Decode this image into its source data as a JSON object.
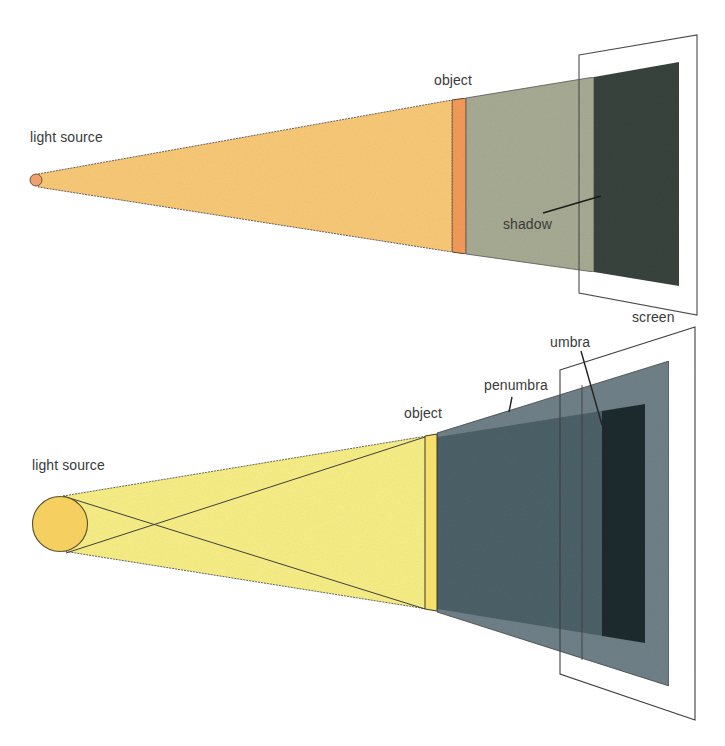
{
  "diagrams": [
    {
      "id": "point-source",
      "labels": {
        "light_source": "light source",
        "object": "object",
        "shadow": "shadow",
        "screen": "screen"
      },
      "colors": {
        "light_beam": "#f9c977",
        "light_source": "#f0a06a",
        "object": "#f29b5a",
        "shadow_penumbra_area": "#a7ab93",
        "shadow": "#3a4540",
        "outline": "#4a4a4a"
      }
    },
    {
      "id": "extended-source",
      "labels": {
        "light_source": "light source",
        "object": "object",
        "penumbra": "penumbra",
        "umbra": "umbra",
        "screen": "screen"
      },
      "colors": {
        "light_beam": "#f7ee86",
        "light_source": "#f5d060",
        "object": "#f6df6a",
        "penumbra": "#6f8088",
        "shadow_core_beam": "#4c6068",
        "umbra": "#1f2c2e",
        "outline": "#3e3e3e"
      }
    }
  ]
}
